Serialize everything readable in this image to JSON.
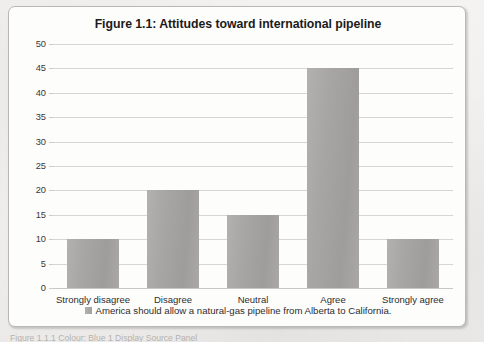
{
  "figure": {
    "title": "Figure 1.1: Attitudes toward international pipeline",
    "legend_swatch_name": "legend-color-swatch",
    "caption_cut_off": "Figure 1.1.1  Colour: Blue  1 Display Source Panel"
  },
  "chart_data": {
    "type": "bar",
    "title": "Figure 1.1: Attitudes toward international pipeline",
    "categories": [
      "Strongly disagree",
      "Disagree",
      "Neutral",
      "Agree",
      "Strongly agree"
    ],
    "values": [
      10,
      20,
      15,
      45,
      10
    ],
    "series": [
      {
        "name": "America should allow a natural-gas pipeline from Alberta to California.",
        "values": [
          10,
          20,
          15,
          45,
          10
        ]
      }
    ],
    "xlabel": "",
    "ylabel": "",
    "ylim": [
      0,
      50
    ],
    "ytick_labels": [
      "0",
      "5",
      "10",
      "15",
      "20",
      "25",
      "30",
      "35",
      "40",
      "45",
      "50"
    ],
    "ytick_values": [
      0,
      5,
      10,
      15,
      20,
      25,
      30,
      35,
      40,
      45,
      50
    ],
    "grid": true,
    "legend_position": "bottom",
    "legend_entries": [
      "America should allow a natural-gas pipeline from Alberta to California."
    ],
    "bar_color": "#a7a6a5",
    "gridline_color": "#d6d5d3",
    "plot_background": "#fdfdfc"
  }
}
